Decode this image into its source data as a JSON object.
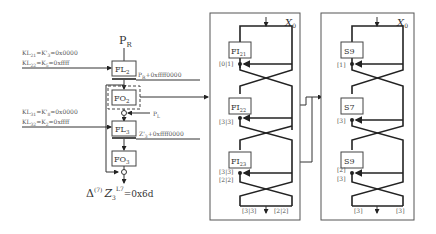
{
  "left": {
    "input_top": "P",
    "input_top_sub": "R",
    "keys_round2": [
      {
        "lhs": "KL",
        "lhs_sub": "21",
        "mid": "=K'",
        "mid_sub": "3",
        "rhs": "=0x0000"
      },
      {
        "lhs": "KL",
        "lhs_sub": "22",
        "mid": "=K",
        "mid_sub": "5",
        "rhs": "=0xffff"
      }
    ],
    "keys_round3": [
      {
        "lhs": "KL",
        "lhs_sub": "31",
        "mid": "=K'",
        "mid_sub": "8",
        "rhs": "=0x0000"
      },
      {
        "lhs": "KL",
        "lhs_sub": "32",
        "mid": "=K",
        "mid_sub": "2",
        "rhs": "=0xffff"
      }
    ],
    "blocks": {
      "fl2": {
        "label": "FL",
        "sub": "2"
      },
      "fo2": {
        "label": "FO",
        "sub": "2"
      },
      "fl3": {
        "label": "FL",
        "sub": "3"
      },
      "fo3": {
        "label": "FO",
        "sub": "3"
      }
    },
    "fl2_out": {
      "label": "P",
      "sub": "R",
      "rhs": "+0xffff0000"
    },
    "pl_label": {
      "label": "P",
      "sub": "L"
    },
    "fl3_out": {
      "label": "Z'",
      "sub": "3",
      "rhs": "+0xffff0000"
    },
    "result": {
      "delta": "Δ",
      "sup": "(7)",
      "z": "Z",
      "z_sub": "3",
      "z_sup": "L7",
      "rhs": "=0x6d"
    }
  },
  "middle_panel": {
    "input_label": "X",
    "input_sub": "0",
    "blocks": [
      {
        "label": "FI",
        "sub": "21",
        "tag": "[0|1]"
      },
      {
        "label": "FI",
        "sub": "22",
        "tag": "[3|3]"
      },
      {
        "label": "FI",
        "sub": "23",
        "tag": "[3|3]",
        "tag2": "[2|2]"
      }
    ],
    "out_left": "[3|3]",
    "out_right": "[2|2]"
  },
  "right_panel": {
    "input_label": "X",
    "input_sub": "0",
    "blocks": [
      {
        "label": "S9",
        "tag": "[1]"
      },
      {
        "label": "S7",
        "tag": "[3]"
      },
      {
        "label": "S9",
        "tag": "[2]",
        "tag2": "[3]"
      }
    ],
    "out_left": "[3]",
    "out_right": "[3]"
  }
}
